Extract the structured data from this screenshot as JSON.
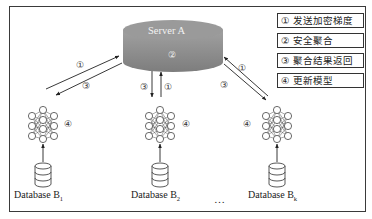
{
  "server": {
    "label": "Server A",
    "step": "②",
    "color": "#8c8c8c"
  },
  "legend": [
    {
      "num": "①",
      "text": "① 发送加密梯度"
    },
    {
      "num": "②",
      "text": "② 安全聚合"
    },
    {
      "num": "③",
      "text": "③ 聚合结果返回"
    },
    {
      "num": "④",
      "text": "④ 更新模型"
    }
  ],
  "clients": [
    {
      "name": "Database B",
      "sub": "1",
      "up_label": "①",
      "down_label": "③",
      "update_label": "④"
    },
    {
      "name": "Database B",
      "sub": "2",
      "up_label": "①",
      "down_label": "③",
      "update_label": "④"
    },
    {
      "name": "Database B",
      "sub": "k",
      "up_label": "①",
      "down_label": "③",
      "update_label": "④"
    }
  ],
  "ellipsis": "…"
}
